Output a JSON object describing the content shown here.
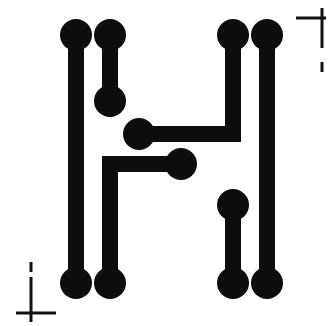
{
  "document": {
    "title": "PCB Trace Letter H",
    "background_color": "#ffffff",
    "ink_color": "#0d0d0d",
    "mark_color": "#111111",
    "width": 329,
    "height": 326
  },
  "artwork": {
    "name": "letter-h-pcb-trace",
    "description": "Stylized capital letter H drawn as printed-circuit-board traces with round solder pads at every trace terminus",
    "glyph": "H",
    "style": "pcb-trace",
    "stroke_width": 16,
    "pad_radius": 16,
    "pad_count": 12,
    "trace_count": 6
  },
  "pads": [
    {
      "id": "pad-top-left-outer",
      "cx": 76,
      "cy": 35,
      "r": 16
    },
    {
      "id": "pad-top-left-inner",
      "cx": 110,
      "cy": 35,
      "r": 16
    },
    {
      "id": "pad-upper-left-stub",
      "cx": 110,
      "cy": 101,
      "r": 16
    },
    {
      "id": "pad-crossbar-upper",
      "cx": 139,
      "cy": 134,
      "r": 16
    },
    {
      "id": "pad-crossbar-lower",
      "cx": 181,
      "cy": 164,
      "r": 16
    },
    {
      "id": "pad-top-right-inner",
      "cx": 233,
      "cy": 35,
      "r": 16
    },
    {
      "id": "pad-top-right-outer",
      "cx": 267,
      "cy": 35,
      "r": 16
    },
    {
      "id": "pad-lower-right-stub",
      "cx": 233,
      "cy": 205,
      "r": 16
    },
    {
      "id": "pad-bottom-left-outer",
      "cx": 76,
      "cy": 283,
      "r": 16
    },
    {
      "id": "pad-bottom-left-inner",
      "cx": 110,
      "cy": 283,
      "r": 16
    },
    {
      "id": "pad-bottom-right-inner",
      "cx": 233,
      "cy": 283,
      "r": 16
    },
    {
      "id": "pad-bottom-right-outer",
      "cx": 267,
      "cy": 283,
      "r": 16
    }
  ],
  "traces": [
    {
      "id": "trace-left-outer-stem",
      "points": "76,35 76,283"
    },
    {
      "id": "trace-left-inner-stub",
      "points": "110,35 110,101"
    },
    {
      "id": "trace-right-outer-stem",
      "points": "267,35 267,283"
    },
    {
      "id": "trace-right-inner-stub",
      "points": "233,205 233,283"
    },
    {
      "id": "trace-crossbar-upper",
      "points": "139,134 233,134 233,35"
    },
    {
      "id": "trace-crossbar-lower",
      "points": "181,164 110,164 110,283"
    }
  ],
  "registration_marks": {
    "top_right": {
      "id": "crop-mark-top-right",
      "horizontal": {
        "x1": 296,
        "y1": 18,
        "x2": 326,
        "y2": 18
      },
      "vertical": {
        "x1": 322,
        "y1": 8,
        "x2": 322,
        "y2": 48
      },
      "tick": {
        "x1": 322,
        "y1": 62,
        "x2": 322,
        "y2": 72
      },
      "stroke_width": 3
    },
    "bottom_left": {
      "id": "crop-mark-bottom-left",
      "horizontal": {
        "x1": 16,
        "y1": 313,
        "x2": 56,
        "y2": 313
      },
      "vertical": {
        "x1": 31,
        "y1": 277,
        "x2": 31,
        "y2": 322
      },
      "tick": {
        "x1": 31,
        "y1": 262,
        "x2": 31,
        "y2": 272
      },
      "stroke_width": 3
    }
  }
}
